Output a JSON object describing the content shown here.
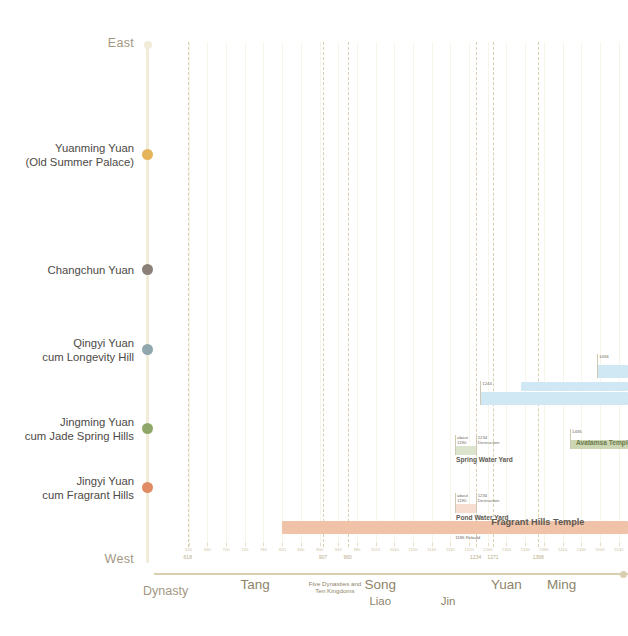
{
  "axes": {
    "vertical": {
      "top_label": "East",
      "bottom_label": "West",
      "name": "geography-axis"
    },
    "horizontal": {
      "name": "Dynasty",
      "year_min": 580,
      "year_max": 1560
    }
  },
  "gardens": [
    {
      "id": "yuanming-yuan",
      "label_line1": "Yuanming Yuan",
      "label_line2": "(Old Summer Palace)",
      "color": "#e5b35a",
      "y": 149
    },
    {
      "id": "changchun-yuan",
      "label_line1": "Changchun Yuan",
      "label_line2": "",
      "color": "#8b8078",
      "y": 264
    },
    {
      "id": "qingyi-yuan",
      "label_line1": "Qingyi Yuan",
      "label_line2": "cum Longevity Hill",
      "color": "#8fa7ad",
      "y": 344
    },
    {
      "id": "jingming-yuan",
      "label_line1": "Jingming Yuan",
      "label_line2": "cum Jade Spring Hills",
      "color": "#8fa86a",
      "y": 423
    },
    {
      "id": "jingyi-yuan",
      "label_line1": "Jingyi Yuan",
      "label_line2": "cum Fragrant Hills",
      "color": "#e08b63",
      "y": 482
    }
  ],
  "dynasty_boundaries": [
    618,
    907,
    960,
    1234,
    1271,
    1368
  ],
  "decade_ticks": [
    620,
    660,
    700,
    740,
    780,
    820,
    860,
    900,
    940,
    980,
    1020,
    1060,
    1100,
    1140,
    1180,
    1220,
    1260,
    1300,
    1340,
    1380,
    1420,
    1460,
    1500,
    1540
  ],
  "dynasty_tick_labels": [
    {
      "year": 618,
      "label": "618"
    },
    {
      "year": 907,
      "label": "907"
    },
    {
      "year": 960,
      "label": "960"
    },
    {
      "year": 1234,
      "label": "1234"
    },
    {
      "year": 1271,
      "label": "1271"
    },
    {
      "year": 1368,
      "label": "1368"
    }
  ],
  "dynasties": [
    {
      "label": "Tang",
      "year": 762,
      "style": "major"
    },
    {
      "label": "Five Dynasties and\nTen Kingdoms",
      "year": 933,
      "style": "tiny"
    },
    {
      "label": "Song",
      "year": 1030,
      "style": "major"
    },
    {
      "label": "Liao",
      "year": 1030,
      "style": "sub"
    },
    {
      "label": "Jin",
      "year": 1175,
      "style": "sub"
    },
    {
      "label": "Yuan",
      "year": 1300,
      "style": "major"
    },
    {
      "label": "Ming",
      "year": 1418,
      "style": "major"
    }
  ],
  "bars": [
    {
      "id": "qingyi-bar-1494",
      "title": "",
      "color": "#cfe8f4",
      "start": 1494,
      "end": 1560,
      "y": 365,
      "height": 13,
      "annotations": [
        {
          "text": "1494",
          "year": 1494,
          "rule": true
        }
      ]
    },
    {
      "id": "qingyi-bar-mid",
      "title": "",
      "color": "#cfe8f4",
      "start": 1330,
      "end": 1560,
      "y": 382,
      "height": 9,
      "annotations": []
    },
    {
      "id": "qingyi-bar-1244",
      "title": "",
      "color": "#cfe8f4",
      "start": 1244,
      "end": 1560,
      "y": 392,
      "height": 13,
      "annotations": [
        {
          "text": "1244",
          "year": 1244,
          "rule": true
        }
      ]
    },
    {
      "id": "avatamsa-temple",
      "title": "Avatamsa Temple",
      "title_small": true,
      "title_color": "#6b7a4b",
      "color": "#cdd6b3",
      "start": 1436,
      "end": 1560,
      "y": 440,
      "height": 9,
      "annotations": [
        {
          "text": "1436",
          "year": 1436,
          "rule": true
        }
      ]
    },
    {
      "id": "spring-water-yard",
      "title": "Spring Water Yard",
      "title_small": true,
      "title_color": "#5e5a52",
      "color": "#dde4cd",
      "start": 1190,
      "end": 1234,
      "y": 446,
      "height": 9,
      "annotations": [
        {
          "text": "about\n1190",
          "year": 1190,
          "rule": true
        },
        {
          "text": "1234\nDestruction",
          "year": 1234,
          "rule": true
        }
      ]
    },
    {
      "id": "pond-water-yard",
      "title": "Pond Water Yard",
      "title_small": true,
      "title_color": "#5e5a52",
      "color": "#f6ddd0",
      "start": 1190,
      "end": 1234,
      "y": 504,
      "height": 9,
      "annotations": [
        {
          "text": "about\n1190",
          "year": 1190,
          "rule": true
        },
        {
          "text": "1234\nDestruction",
          "year": 1234,
          "rule": true
        }
      ]
    },
    {
      "id": "fragrant-hills-temple",
      "title": "Fragrant Hills Temple",
      "title_small": false,
      "title_color": "#5e5a52",
      "color": "#f0c3a9",
      "start": 820,
      "end": 1560,
      "y": 521,
      "height": 13,
      "annotations": [
        {
          "text": "1186 Rebuild",
          "year": 1186,
          "rule": false,
          "below": true
        }
      ]
    }
  ]
}
